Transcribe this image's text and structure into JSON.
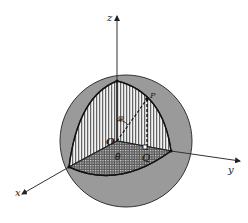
{
  "figure": {
    "labels": {
      "z_axis": "z",
      "x_axis": "x",
      "y_axis": "y",
      "origin": "O",
      "point": "P",
      "projection": "Q",
      "polar_angle": "φ",
      "azimuthal_angle": "θ"
    },
    "colors": {
      "sphere_fill": "#9a9a9a",
      "sphere_edge": "#333333",
      "axis": "#333333",
      "hatch": "#444444",
      "background": "#ffffff"
    }
  }
}
